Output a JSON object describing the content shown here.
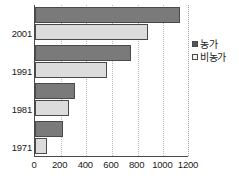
{
  "chart_data": {
    "type": "bar",
    "orientation": "horizontal",
    "title": "",
    "subtitle": "",
    "xlabel": "",
    "ylabel": "",
    "categories": [
      "2001",
      "1991",
      "1981",
      "1971"
    ],
    "series": [
      {
        "name": "농가",
        "values": [
          1130,
          750,
          310,
          220
        ],
        "color": "#7a7a7a"
      },
      {
        "name": "비농가",
        "values": [
          880,
          560,
          265,
          95
        ],
        "color": "#dcdcdc"
      }
    ],
    "xlim": [
      0,
      1200
    ],
    "xticks": [
      0,
      200,
      400,
      600,
      800,
      1000,
      1200
    ],
    "xticklabels": [
      "0",
      "200",
      "400",
      "600",
      "800",
      "1000",
      "1200"
    ],
    "grid": "vertical-dotted",
    "legend_position": "right",
    "legend": [
      {
        "label": "농가",
        "swatch": "filled-dark-square"
      },
      {
        "label": "비농가",
        "swatch": "open-light-square"
      }
    ]
  },
  "colors": {
    "series_a": "#7a7a7a",
    "series_b": "#dcdcdc",
    "axis": "#4a4a4a",
    "grid": "#b9b9b9",
    "text": "#1a1a1a",
    "background": "#ffffff"
  }
}
